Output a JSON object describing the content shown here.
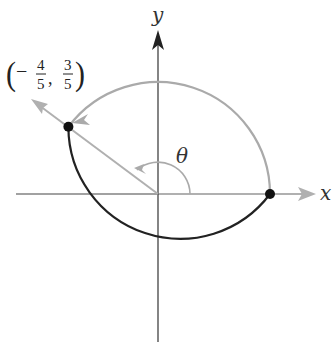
{
  "diagram": {
    "type": "unit-circle-angle",
    "axes": {
      "x_label": "x",
      "y_label": "y"
    },
    "angle_label": "θ",
    "point": {
      "label_open": "(",
      "sign": "−",
      "x_num": "4",
      "x_den": "5",
      "comma": ",",
      "y_num": "3",
      "y_den": "5",
      "label_close": ")",
      "coords": [
        -0.8,
        0.6
      ]
    },
    "start_point": {
      "coords": [
        1,
        0
      ]
    },
    "colors": {
      "axis": "#333333",
      "traversed_arc": "#aaaaaa",
      "remaining_arc": "#222222",
      "terminal_ray": "#b0b0b0",
      "point": "#111111"
    }
  }
}
